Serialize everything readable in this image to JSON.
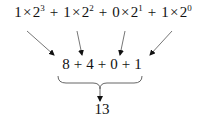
{
  "diagram": {
    "top_terms": [
      {
        "coef": "1",
        "times": "×",
        "base": "2",
        "exp": "3"
      },
      {
        "coef": "1",
        "times": "×",
        "base": "2",
        "exp": "2"
      },
      {
        "coef": "0",
        "times": "×",
        "base": "2",
        "exp": "1"
      },
      {
        "coef": "1",
        "times": "×",
        "base": "2",
        "exp": "0"
      }
    ],
    "plus": "+",
    "middle_values": [
      "8",
      "4",
      "0",
      "1"
    ],
    "result": "13",
    "colors": {
      "text": "#111111",
      "arrow": "#555555",
      "arrowhead": "#111111"
    }
  }
}
